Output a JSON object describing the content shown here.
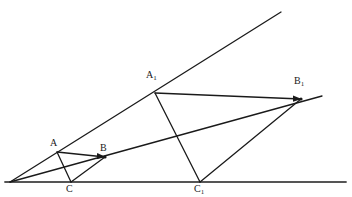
{
  "figure": {
    "type": "geometry-diagram",
    "canvas": {
      "width": 352,
      "height": 197,
      "background": "#ffffff"
    },
    "colors": {
      "stroke": "#1a1a1a",
      "baseline_stroke": "#555555",
      "label_text": "#1a1a1a"
    },
    "points": [
      {
        "id": "O",
        "label": "",
        "sub": "",
        "x": 10,
        "y": 182,
        "label_x": 0,
        "label_y": 0,
        "show_label": false
      },
      {
        "id": "A",
        "label": "A",
        "sub": "",
        "x": 57,
        "y": 152,
        "label_x": 50,
        "label_y": 138,
        "show_label": true
      },
      {
        "id": "B",
        "label": "B",
        "sub": "",
        "x": 105,
        "y": 157,
        "label_x": 100,
        "label_y": 143,
        "show_label": true
      },
      {
        "id": "C",
        "label": "C",
        "sub": "",
        "x": 71,
        "y": 182,
        "label_x": 66,
        "label_y": 184,
        "show_label": true
      },
      {
        "id": "A1",
        "label": "A",
        "sub": "1",
        "x": 155,
        "y": 93,
        "label_x": 146,
        "label_y": 70,
        "show_label": true
      },
      {
        "id": "B1",
        "label": "B",
        "sub": "1",
        "x": 301,
        "y": 99,
        "label_x": 294,
        "label_y": 76,
        "show_label": true
      },
      {
        "id": "C1",
        "label": "C",
        "sub": "1",
        "x": 200,
        "y": 182,
        "label_x": 194,
        "label_y": 184,
        "show_label": true
      }
    ],
    "segments": [
      {
        "name": "baseline",
        "x1": 5,
        "y1": 182,
        "x2": 346,
        "y2": 182,
        "width": 1.8,
        "color": "#555555",
        "arrow": false
      },
      {
        "name": "ray-O-A-A1",
        "x1": 10,
        "y1": 182,
        "x2": 281,
        "y2": 12,
        "width": 1.3,
        "color": "#1a1a1a",
        "arrow": false
      },
      {
        "name": "ray-O-B-B1",
        "x1": 10,
        "y1": 182,
        "x2": 322,
        "y2": 96,
        "width": 1.3,
        "color": "#1a1a1a",
        "arrow": false
      },
      {
        "name": "segment-A-B",
        "x1": 57,
        "y1": 152,
        "x2": 105,
        "y2": 157,
        "width": 1.3,
        "color": "#1a1a1a",
        "arrow": true
      },
      {
        "name": "segment-A-C",
        "x1": 57,
        "y1": 152,
        "x2": 71,
        "y2": 182,
        "width": 1.3,
        "color": "#1a1a1a",
        "arrow": false
      },
      {
        "name": "segment-C-B",
        "x1": 71,
        "y1": 182,
        "x2": 105,
        "y2": 157,
        "width": 1.3,
        "color": "#1a1a1a",
        "arrow": false
      },
      {
        "name": "segment-A1-B1",
        "x1": 155,
        "y1": 93,
        "x2": 301,
        "y2": 99,
        "width": 1.3,
        "color": "#1a1a1a",
        "arrow": true
      },
      {
        "name": "segment-A1-C1",
        "x1": 155,
        "y1": 93,
        "x2": 200,
        "y2": 182,
        "width": 1.3,
        "color": "#1a1a1a",
        "arrow": false
      },
      {
        "name": "segment-C1-B1",
        "x1": 200,
        "y1": 182,
        "x2": 301,
        "y2": 99,
        "width": 1.3,
        "color": "#1a1a1a",
        "arrow": false
      }
    ],
    "vertex_dots": [
      {
        "name": "dot-B",
        "x": 105,
        "y": 157,
        "r": 1.6
      },
      {
        "name": "dot-B1",
        "x": 301,
        "y": 99,
        "r": 1.6
      }
    ]
  }
}
